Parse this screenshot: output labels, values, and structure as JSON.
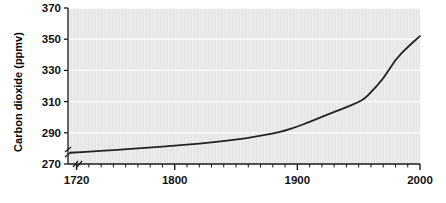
{
  "chart_data": {
    "type": "line",
    "title": "",
    "xlabel": "",
    "ylabel": "Carbon dioxide (ppmv)",
    "xlim": [
      1713,
      2000
    ],
    "ylim": [
      270,
      370
    ],
    "yticks": [
      270,
      290,
      310,
      330,
      350,
      370
    ],
    "ytick_labels": [
      "270",
      "290",
      "310",
      "330",
      "350",
      "370"
    ],
    "xticks": [
      1720,
      1800,
      1900,
      2000
    ],
    "xtick_labels": [
      "1720",
      "1800",
      "1900",
      "2000"
    ],
    "x_minor_tick_step": 10,
    "grid": "horizontal-only",
    "grid_color": "#ffffff",
    "plot_background": "#e9e9e9",
    "line_color": "#232323",
    "line_width": 1.8,
    "legend": "none",
    "axis_break": {
      "y_axis": true,
      "x_axis": true,
      "note": "double-slash break marks near origin"
    },
    "series": [
      {
        "name": "Carbon dioxide",
        "x": [
          1715,
          1740,
          1760,
          1780,
          1800,
          1820,
          1840,
          1855,
          1865,
          1880,
          1890,
          1900,
          1910,
          1920,
          1930,
          1940,
          1950,
          1955,
          1960,
          1970,
          1980,
          1990,
          2000
        ],
        "values": [
          277.2,
          278.3,
          279.4,
          280.6,
          281.8,
          283.0,
          284.6,
          286.2,
          287.4,
          289.6,
          291.4,
          294.0,
          297.0,
          300.2,
          303.4,
          306.4,
          309.8,
          312.0,
          316.0,
          324.5,
          337.0,
          345.0,
          352.0
        ]
      }
    ]
  },
  "axis": {
    "y_title": "Carbon dioxide (ppmv)"
  }
}
